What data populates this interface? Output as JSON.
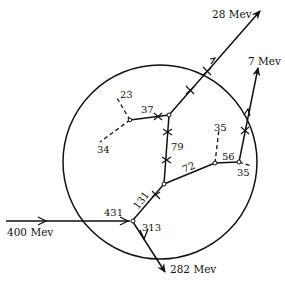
{
  "diagram": {
    "type": "particle-interaction-star",
    "boundary": "circle",
    "labels": {
      "incoming": "400 Mev",
      "out_28": "28 Mev",
      "out_7": "7 Mev",
      "out_282": "282 Mev",
      "n431": "431",
      "n313": "313",
      "n131": "131",
      "n79": "79",
      "n72": "72",
      "n37": "37",
      "n23": "23",
      "n34": "34",
      "n35a": "35",
      "n56": "56",
      "n35b": "35"
    }
  }
}
